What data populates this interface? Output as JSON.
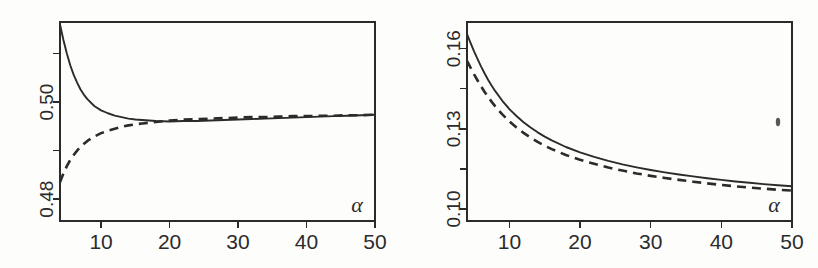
{
  "figure": {
    "background_color": "#fdfdfc",
    "ink_color": "#2b2b2b",
    "panel_count": 2
  },
  "chart_data": [
    {
      "type": "line",
      "panel": "left",
      "title": "",
      "xlabel": "α",
      "ylabel": "",
      "xlim": [
        4,
        50
      ],
      "ylim": [
        0.4755,
        0.5165
      ],
      "xticks": [
        10,
        20,
        30,
        40,
        50
      ],
      "xtick_labels": [
        "10",
        "20",
        "30",
        "40",
        "50"
      ],
      "yticks": [
        0.48,
        0.49,
        0.5,
        0.51
      ],
      "ytick_labels": [
        "0.48",
        "",
        "0.50",
        ""
      ],
      "ytick_labels_shown": [
        "0.48",
        "0.50"
      ],
      "grid": false,
      "legend": null,
      "series": [
        {
          "name": "solid",
          "style": "solid",
          "x": [
            4,
            4.5,
            5,
            5.5,
            6,
            6.5,
            7,
            7.5,
            8,
            9,
            10,
            11,
            12,
            13,
            14,
            15,
            16,
            17,
            18,
            20,
            22,
            24,
            26,
            28,
            30,
            32,
            34,
            36,
            38,
            40,
            42,
            44,
            46,
            48,
            50
          ],
          "values": [
            0.516,
            0.5128,
            0.51,
            0.5076,
            0.5056,
            0.504,
            0.5026,
            0.5015,
            0.5006,
            0.4992,
            0.4983,
            0.4977,
            0.4972,
            0.4969,
            0.4966,
            0.4964,
            0.4963,
            0.4962,
            0.4961,
            0.496,
            0.4961,
            0.4961,
            0.4962,
            0.4963,
            0.4964,
            0.4965,
            0.4966,
            0.4967,
            0.4968,
            0.4969,
            0.497,
            0.4971,
            0.4972,
            0.4973,
            0.4974
          ]
        },
        {
          "name": "dashed",
          "style": "dashed",
          "x": [
            4,
            4.5,
            5,
            5.5,
            6,
            6.5,
            7,
            8,
            9,
            10,
            11,
            12,
            13,
            14,
            15,
            16,
            18,
            20,
            22,
            24,
            26,
            28,
            30,
            32,
            34,
            36,
            38,
            40,
            42,
            44,
            46,
            48,
            50
          ],
          "values": [
            0.4835,
            0.4853,
            0.4868,
            0.4881,
            0.4891,
            0.49,
            0.4908,
            0.492,
            0.4929,
            0.4936,
            0.4941,
            0.4945,
            0.4949,
            0.4952,
            0.4954,
            0.4956,
            0.4959,
            0.4962,
            0.4964,
            0.4965,
            0.4966,
            0.4967,
            0.4968,
            0.4969,
            0.4969,
            0.497,
            0.4971,
            0.4971,
            0.4972,
            0.4972,
            0.4973,
            0.4973,
            0.4974
          ]
        }
      ]
    },
    {
      "type": "line",
      "panel": "right",
      "title": "",
      "xlabel": "α",
      "ylabel": "",
      "xlim": [
        4,
        50
      ],
      "ylim": [
        0.0955,
        0.17
      ],
      "xticks": [
        10,
        20,
        30,
        40,
        50
      ],
      "xtick_labels": [
        "10",
        "20",
        "30",
        "40",
        "50"
      ],
      "yticks": [
        0.1,
        0.115,
        0.13,
        0.145,
        0.16
      ],
      "ytick_labels": [
        "0.10",
        "",
        "0.13",
        "",
        "0.16"
      ],
      "ytick_labels_shown": [
        "0.10",
        "0.13",
        "0.16"
      ],
      "grid": false,
      "legend": null,
      "series": [
        {
          "name": "solid",
          "style": "solid",
          "x": [
            4,
            4.5,
            5,
            5.5,
            6,
            6.5,
            7,
            7.5,
            8,
            9,
            10,
            11,
            12,
            13,
            14,
            15,
            16,
            18,
            20,
            22,
            24,
            26,
            28,
            30,
            32,
            34,
            36,
            38,
            40,
            42,
            44,
            46,
            48,
            50
          ],
          "values": [
            0.1655,
            0.1622,
            0.159,
            0.1561,
            0.1533,
            0.1507,
            0.1483,
            0.1461,
            0.1441,
            0.1405,
            0.1374,
            0.1348,
            0.1325,
            0.1305,
            0.1287,
            0.1271,
            0.1257,
            0.1232,
            0.1212,
            0.1195,
            0.118,
            0.1167,
            0.1156,
            0.1146,
            0.1137,
            0.1129,
            0.1122,
            0.1115,
            0.1109,
            0.1103,
            0.1098,
            0.1093,
            0.1089,
            0.1085
          ]
        },
        {
          "name": "dashed",
          "style": "dashed",
          "x": [
            4,
            4.5,
            5,
            5.5,
            6,
            6.5,
            7,
            7.5,
            8,
            9,
            10,
            11,
            12,
            13,
            14,
            15,
            16,
            18,
            20,
            22,
            24,
            26,
            28,
            30,
            32,
            34,
            36,
            38,
            40,
            42,
            44,
            46,
            48,
            50
          ],
          "values": [
            0.1555,
            0.1529,
            0.1504,
            0.1481,
            0.1459,
            0.1438,
            0.1419,
            0.1401,
            0.1384,
            0.1354,
            0.1328,
            0.1305,
            0.1285,
            0.1267,
            0.1251,
            0.1237,
            0.1224,
            0.1202,
            0.1184,
            0.1169,
            0.1155,
            0.1144,
            0.1133,
            0.1124,
            0.1116,
            0.1109,
            0.1102,
            0.1096,
            0.109,
            0.1085,
            0.108,
            0.1076,
            0.1072,
            0.1069
          ]
        }
      ]
    }
  ]
}
